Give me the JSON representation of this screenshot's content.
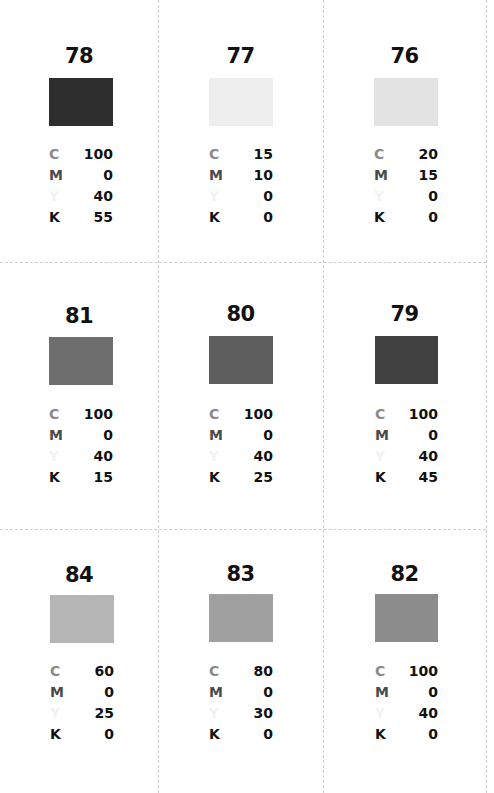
{
  "labels": {
    "c": "C",
    "m": "M",
    "y": "Y",
    "k": "K"
  },
  "swatches": [
    {
      "number": "78",
      "color": "#2e2e2e",
      "c": "100",
      "m": "0",
      "y": "40",
      "k": "55"
    },
    {
      "number": "77",
      "color": "#eeeeee",
      "c": "15",
      "m": "10",
      "y": "0",
      "k": "0"
    },
    {
      "number": "76",
      "color": "#e3e3e3",
      "c": "20",
      "m": "15",
      "y": "0",
      "k": "0"
    },
    {
      "number": "81",
      "color": "#6e6e6e",
      "c": "100",
      "m": "0",
      "y": "40",
      "k": "15"
    },
    {
      "number": "80",
      "color": "#5e5e5e",
      "c": "100",
      "m": "0",
      "y": "40",
      "k": "25"
    },
    {
      "number": "79",
      "color": "#414141",
      "c": "100",
      "m": "0",
      "y": "40",
      "k": "45"
    },
    {
      "number": "84",
      "color": "#b5b5b5",
      "c": "60",
      "m": "0",
      "y": "25",
      "k": "0"
    },
    {
      "number": "83",
      "color": "#a0a0a0",
      "c": "80",
      "m": "0",
      "y": "30",
      "k": "0"
    },
    {
      "number": "82",
      "color": "#8c8c8c",
      "c": "100",
      "m": "0",
      "y": "40",
      "k": "0"
    }
  ]
}
